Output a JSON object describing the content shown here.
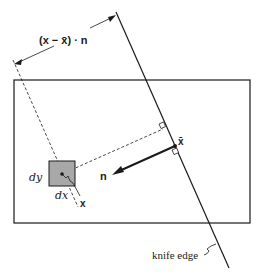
{
  "diagram": {
    "labels": {
      "projection": "(x − x̄) · n",
      "x_bar": "x̄",
      "n": "n",
      "x": "x",
      "dx": "dx",
      "dy": "dy",
      "knife_edge": "knife edge"
    },
    "colors": {
      "stroke": "#1a1a1a",
      "element_fill": "#a8a8a8",
      "background": "#ffffff"
    }
  }
}
